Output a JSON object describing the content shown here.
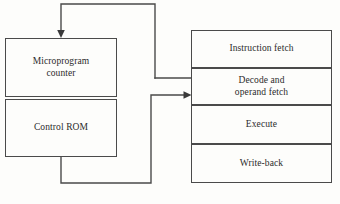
{
  "diagram": {
    "control_unit": {
      "counter_label": "Microprogram\ncounter",
      "rom_label": "Control ROM"
    },
    "pipeline": {
      "stages": [
        {
          "label": "Instruction fetch"
        },
        {
          "label": "Decode and\noperand fetch"
        },
        {
          "label": "Execute"
        },
        {
          "label": "Write-back"
        }
      ]
    },
    "connectors": [
      {
        "name": "feedback-to-counter",
        "arrowhead": true
      },
      {
        "name": "control-rom-to-pipeline",
        "arrowhead": true
      },
      {
        "name": "pipeline-tap-to-feedback",
        "arrowhead": false
      }
    ],
    "colors": {
      "line": "#4a4a4a",
      "text": "#2b2b2b",
      "background": "#fdfdfb"
    },
    "caption": ""
  }
}
